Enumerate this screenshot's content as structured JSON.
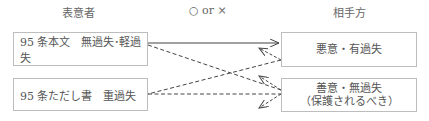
{
  "headers": {
    "left": "表意者",
    "middle": "○ or ×",
    "right": "相手方"
  },
  "left_boxes": [
    {
      "label": "95 条本文　無過失･軽過失"
    },
    {
      "label": "95 条ただし書　重過失"
    }
  ],
  "right_boxes": [
    {
      "line1": "悪意・有過失",
      "line2": ""
    },
    {
      "line1": "善意・無過失",
      "line2": "（保護されるべき）"
    }
  ],
  "arrows": [
    {
      "from": "left_boxes.0",
      "to": "right_boxes.0",
      "style": "solid",
      "direction": "forward"
    },
    {
      "from": "right_boxes.0",
      "to": "left_boxes.1",
      "style": "dashed",
      "direction": "back"
    },
    {
      "from": "left_boxes.0",
      "to": "right_boxes.1",
      "style": "dashed",
      "direction": "back"
    },
    {
      "from": "left_boxes.1",
      "to": "right_boxes.1",
      "style": "dashed",
      "direction": "back"
    }
  ]
}
